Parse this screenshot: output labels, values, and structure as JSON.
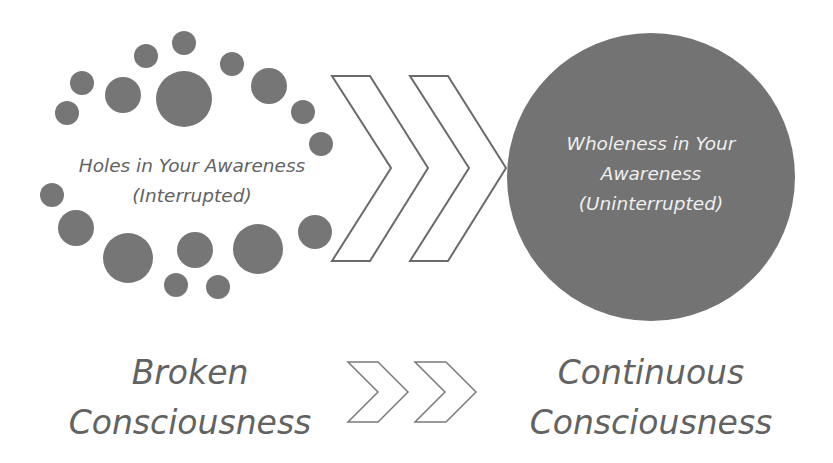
{
  "diagram": {
    "left_group": {
      "line1": "Holes in Your Awareness",
      "line2": "(Interrupted)"
    },
    "right_circle": {
      "line1": "Wholeness in Your",
      "line2": "Awareness",
      "line3": "(Uninterrupted)"
    },
    "bottom_left": {
      "line1": "Broken",
      "line2": "Consciousness"
    },
    "bottom_right": {
      "line1": "Continuous",
      "line2": "Consciousness"
    },
    "colors": {
      "dot": "#767676",
      "big_circle": "#737373",
      "text": "#626262",
      "circle_text": "#efefef",
      "chevron_stroke": "#6a6a6a"
    }
  }
}
